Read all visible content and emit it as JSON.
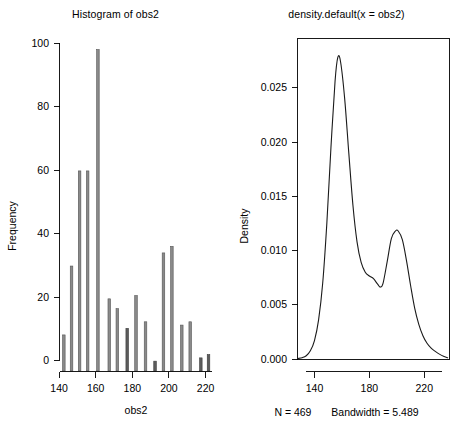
{
  "figure": {
    "width": 462,
    "height": 435,
    "background": "#ffffff",
    "foreground": "#000000"
  },
  "chart_data": [
    {
      "type": "bar",
      "title": "Histogram of obs2",
      "xlabel": "obs2",
      "ylabel": "Frequency",
      "xlim": [
        140.5,
        223.5
      ],
      "ylim": [
        0,
        100
      ],
      "xticks": [
        140,
        160,
        180,
        200,
        220
      ],
      "xticklabels": [
        "140",
        "160",
        "180",
        "200",
        "220"
      ],
      "yticks": [
        0,
        20,
        40,
        60,
        80,
        100
      ],
      "yticklabels": [
        "0",
        "20",
        "40",
        "60",
        "80",
        "100"
      ],
      "grid": false,
      "legend": "none",
      "bar_fill": "#8a8a8a",
      "bar_edge": "#555555",
      "bin_width": 1.4,
      "bin_centers": [
        142.6,
        146.8,
        151.2,
        155.6,
        161.2,
        167.4,
        171.8,
        177.2,
        182.0,
        187.2,
        192.4,
        197.0,
        201.6,
        207.0,
        211.6,
        217.4,
        221.6
      ],
      "values": [
        11,
        32,
        61,
        61,
        98,
        22,
        19,
        13,
        23,
        15,
        3,
        36,
        38,
        14,
        15,
        4,
        5
      ]
    },
    {
      "type": "line",
      "title": "density.default(x = obs2)",
      "xlabel": "",
      "ylabel": "Density",
      "xlim": [
        128,
        238
      ],
      "ylim": [
        0.0,
        0.0295
      ],
      "xticks": [
        140,
        180,
        220
      ],
      "xticklabels": [
        "140",
        "180",
        "220"
      ],
      "yticks": [
        0.0,
        0.005,
        0.01,
        0.015,
        0.02,
        0.025
      ],
      "yticklabels": [
        "0.000",
        "0.005",
        "0.010",
        "0.015",
        "0.020",
        "0.025"
      ],
      "grid": false,
      "legend": "none",
      "line_color": "#1a1a1a",
      "x": [
        128,
        131,
        134,
        137,
        140,
        143,
        146,
        149,
        152,
        155,
        157,
        159,
        162,
        165,
        168,
        171,
        174,
        177,
        180,
        183,
        186,
        188,
        190,
        193,
        196,
        199,
        201,
        204,
        207,
        210,
        213,
        216,
        219,
        222,
        225,
        228,
        231,
        234,
        237
      ],
      "y": [
        5e-05,
        0.00012,
        0.0003,
        0.00075,
        0.0017,
        0.0036,
        0.007,
        0.0125,
        0.0195,
        0.0256,
        0.0278,
        0.0274,
        0.024,
        0.019,
        0.0142,
        0.0108,
        0.0089,
        0.008,
        0.00765,
        0.0074,
        0.0069,
        0.00663,
        0.007,
        0.009,
        0.0111,
        0.0118,
        0.0118,
        0.011,
        0.0091,
        0.0068,
        0.0047,
        0.0032,
        0.00215,
        0.00145,
        0.001,
        0.0007,
        0.00045,
        0.00025,
        0.00012
      ]
    }
  ],
  "left_panel": {
    "title": "Histogram of obs2",
    "xlabel": "obs2",
    "ylabel": "Frequency"
  },
  "right_panel": {
    "title": "density.default(x = obs2)",
    "ylabel": "Density",
    "footnote_n": "N = 469",
    "footnote_bw": "Bandwidth = 5.489"
  }
}
